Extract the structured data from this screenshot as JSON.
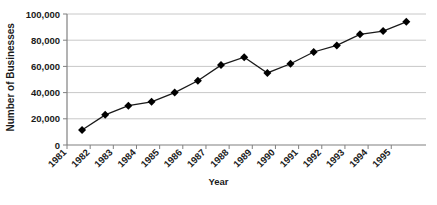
{
  "chart_data": {
    "type": "line",
    "title": "",
    "xlabel": "Year",
    "ylabel": "Number of Businesses",
    "categories": [
      "1981",
      "1982",
      "1983",
      "1984",
      "1985",
      "1986",
      "1987",
      "1988",
      "1989",
      "1990",
      "1991",
      "1992",
      "1993",
      "1994",
      "1995"
    ],
    "values": [
      11500,
      23000,
      30000,
      33000,
      40000,
      49000,
      61000,
      67000,
      55000,
      62000,
      71000,
      76000,
      84500,
      87000,
      94000
    ],
    "series": [
      {
        "name": "Number of Businesses",
        "values": [
          11500,
          23000,
          30000,
          33000,
          40000,
          49000,
          61000,
          67000,
          55000,
          62000,
          71000,
          76000,
          84500,
          87000,
          94000
        ]
      }
    ],
    "ylim": [
      0,
      100000
    ],
    "ytick_labels": [
      "0",
      "20,000",
      "40,000",
      "60,000",
      "80,000",
      "100,000"
    ],
    "ytick_values": [
      0,
      20000,
      40000,
      60000,
      80000,
      100000
    ],
    "xtick_labels": [
      "1981",
      "1982",
      "1983",
      "1984",
      "1985",
      "1986",
      "1987",
      "1988",
      "1989",
      "1990",
      "1991",
      "1992",
      "1993",
      "1994",
      "1995"
    ],
    "grid": true,
    "grid_axis": "y",
    "legend": false,
    "legend_position": "none",
    "marker": "diamond",
    "line_color": "#1a1a1a",
    "marker_color": "#000000",
    "grid_color": "#c8c8c8",
    "axis_color": "#808080",
    "background_color": "#ffffff"
  }
}
